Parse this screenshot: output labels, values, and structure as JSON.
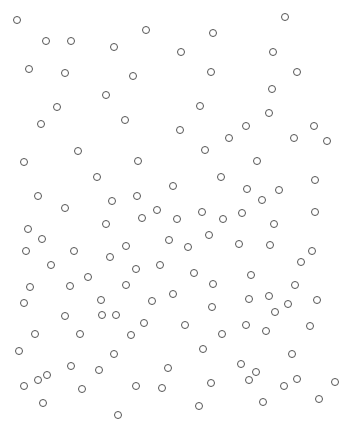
{
  "canvas": {
    "width": 348,
    "height": 433,
    "background": "#ffffff"
  },
  "style": {
    "stroke": "#555555",
    "radius": 4,
    "fill": "none"
  },
  "circles": [
    [
      17,
      20
    ],
    [
      285,
      17
    ],
    [
      46,
      41
    ],
    [
      71,
      41
    ],
    [
      146,
      30
    ],
    [
      114,
      47
    ],
    [
      213,
      33
    ],
    [
      181,
      52
    ],
    [
      273,
      52
    ],
    [
      29,
      69
    ],
    [
      65,
      73
    ],
    [
      133,
      76
    ],
    [
      211,
      72
    ],
    [
      297,
      72
    ],
    [
      106,
      95
    ],
    [
      272,
      89
    ],
    [
      57,
      107
    ],
    [
      200,
      106
    ],
    [
      269,
      113
    ],
    [
      41,
      124
    ],
    [
      125,
      120
    ],
    [
      180,
      130
    ],
    [
      246,
      126
    ],
    [
      229,
      138
    ],
    [
      314,
      126
    ],
    [
      294,
      138
    ],
    [
      327,
      141
    ],
    [
      24,
      162
    ],
    [
      78,
      151
    ],
    [
      138,
      161
    ],
    [
      205,
      150
    ],
    [
      257,
      161
    ],
    [
      97,
      177
    ],
    [
      173,
      186
    ],
    [
      221,
      177
    ],
    [
      315,
      180
    ],
    [
      38,
      196
    ],
    [
      65,
      208
    ],
    [
      112,
      201
    ],
    [
      137,
      196
    ],
    [
      247,
      189
    ],
    [
      262,
      200
    ],
    [
      279,
      190
    ],
    [
      157,
      210
    ],
    [
      202,
      212
    ],
    [
      242,
      213
    ],
    [
      315,
      212
    ],
    [
      274,
      224
    ],
    [
      28,
      229
    ],
    [
      42,
      239
    ],
    [
      106,
      224
    ],
    [
      142,
      218
    ],
    [
      177,
      219
    ],
    [
      223,
      219
    ],
    [
      209,
      235
    ],
    [
      169,
      240
    ],
    [
      126,
      246
    ],
    [
      26,
      251
    ],
    [
      74,
      251
    ],
    [
      110,
      257
    ],
    [
      188,
      247
    ],
    [
      239,
      244
    ],
    [
      270,
      245
    ],
    [
      312,
      251
    ],
    [
      51,
      265
    ],
    [
      136,
      269
    ],
    [
      160,
      265
    ],
    [
      194,
      273
    ],
    [
      251,
      275
    ],
    [
      301,
      262
    ],
    [
      30,
      287
    ],
    [
      70,
      286
    ],
    [
      88,
      277
    ],
    [
      126,
      285
    ],
    [
      213,
      284
    ],
    [
      295,
      285
    ],
    [
      24,
      303
    ],
    [
      101,
      300
    ],
    [
      152,
      301
    ],
    [
      173,
      294
    ],
    [
      249,
      299
    ],
    [
      269,
      296
    ],
    [
      288,
      304
    ],
    [
      317,
      300
    ],
    [
      65,
      316
    ],
    [
      102,
      315
    ],
    [
      116,
      315
    ],
    [
      144,
      323
    ],
    [
      185,
      325
    ],
    [
      212,
      307
    ],
    [
      246,
      325
    ],
    [
      275,
      312
    ],
    [
      310,
      326
    ],
    [
      35,
      334
    ],
    [
      80,
      334
    ],
    [
      131,
      335
    ],
    [
      222,
      334
    ],
    [
      266,
      331
    ],
    [
      19,
      351
    ],
    [
      114,
      354
    ],
    [
      203,
      349
    ],
    [
      292,
      354
    ],
    [
      71,
      366
    ],
    [
      99,
      370
    ],
    [
      168,
      368
    ],
    [
      241,
      364
    ],
    [
      256,
      372
    ],
    [
      335,
      382
    ],
    [
      24,
      386
    ],
    [
      38,
      380
    ],
    [
      47,
      375
    ],
    [
      82,
      389
    ],
    [
      136,
      386
    ],
    [
      162,
      388
    ],
    [
      211,
      383
    ],
    [
      249,
      380
    ],
    [
      284,
      386
    ],
    [
      297,
      379
    ],
    [
      43,
      403
    ],
    [
      263,
      402
    ],
    [
      319,
      399
    ],
    [
      199,
      406
    ],
    [
      118,
      415
    ]
  ]
}
